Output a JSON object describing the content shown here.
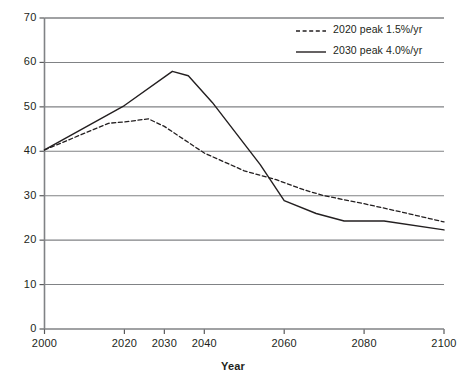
{
  "chart_data": {
    "type": "line",
    "title": "",
    "xlabel": "Year",
    "ylabel": "",
    "xlim": [
      2000,
      2100
    ],
    "ylim": [
      0,
      70
    ],
    "grid": true,
    "grid_axis": "y",
    "legend_position": "top-right",
    "x_tick_labels": [
      "2000",
      "2020",
      "2030",
      "2040",
      "2060",
      "2080",
      "2100"
    ],
    "x_ticks": [
      2000,
      2020,
      2030,
      2040,
      2060,
      2080,
      2100
    ],
    "y_tick_labels": [
      "0",
      "10",
      "20",
      "30",
      "40",
      "50",
      "60",
      "70"
    ],
    "y_ticks": [
      0,
      10,
      20,
      30,
      40,
      50,
      60,
      70
    ],
    "series": [
      {
        "name": "2020 peak 1.5%/yr",
        "style": "dashed",
        "color": "#231f20",
        "x": [
          2000,
          2016,
          2020,
          2026,
          2030,
          2040,
          2050,
          2058,
          2065,
          2070,
          2080,
          2090,
          2100
        ],
        "values": [
          40.3,
          46.3,
          46.6,
          47.3,
          45.6,
          39.6,
          35.6,
          33.6,
          31.3,
          30.0,
          28.2,
          26.2,
          24.1
        ]
      },
      {
        "name": "2030 peak 4.0%/yr",
        "style": "solid",
        "color": "#231f20",
        "x": [
          2000,
          2020,
          2032,
          2036,
          2042,
          2054,
          2060,
          2068,
          2075,
          2085,
          2100
        ],
        "values": [
          40.3,
          50.3,
          58.0,
          57.0,
          51.0,
          37.0,
          28.9,
          26.0,
          24.3,
          24.3,
          22.3
        ]
      }
    ]
  },
  "axis": {
    "x_title": "Year"
  },
  "legend": {
    "entries": [
      {
        "label": "2020 peak 1.5%/yr",
        "style": "dashed"
      },
      {
        "label": "2030 peak 4.0%/yr",
        "style": "solid"
      }
    ]
  }
}
